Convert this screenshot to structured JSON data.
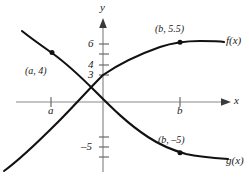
{
  "figure": {
    "background_color": "#ffffff",
    "axis_color": "#808080",
    "curve_color": "#111111",
    "label_color": "#1a1a1a"
  },
  "axes": {
    "x_axis_label": "x",
    "y_axis_label": "y",
    "x_ticks": [
      {
        "label": "a",
        "value": "a",
        "px": 51
      },
      {
        "label": "b",
        "value": "b",
        "px": 180
      }
    ],
    "y_ticks": [
      {
        "label": "6",
        "value": 6,
        "px": 44
      },
      {
        "label": "",
        "value": 5,
        "px": 54
      },
      {
        "label": "4",
        "value": 4,
        "px": 65
      },
      {
        "label": "3",
        "value": 3,
        "px": 75
      },
      {
        "label": "",
        "value": 2,
        "px": 85
      },
      {
        "label": "-5",
        "value": -5,
        "px": 147
      },
      {
        "label": "",
        "value": -4,
        "px": 137
      },
      {
        "label": "",
        "value": -6,
        "px": 157
      }
    ]
  },
  "chart_data": {
    "type": "line",
    "title": "",
    "subtitle": "",
    "xlabel": "x",
    "ylabel": "y",
    "grid": false,
    "legend_position": "inline-curve-end",
    "xlim": [
      -1.45,
      2.2
    ],
    "ylim": [
      -7.0,
      7.6
    ],
    "annotations": [
      {
        "text": "(a, 4)",
        "x": "a",
        "y": 4,
        "series": "g(x)"
      },
      {
        "text": "(b, 5.5)",
        "x": "b",
        "y": 5.5,
        "series": "f(x)"
      },
      {
        "text": "(b, -5)",
        "x": "b",
        "y": -5,
        "series": "g(x)"
      }
    ],
    "marked_points": [
      {
        "label": "(a, 4)",
        "series": "g(x)",
        "x_value": "a",
        "y_value": 4
      },
      {
        "label": "(b, 5.5)",
        "series": "f(x)",
        "x_value": "b",
        "y_value": 5.5
      },
      {
        "label": "(b, -5)",
        "series": "g(x)",
        "x_value": "b",
        "y_value": -5
      }
    ],
    "series": [
      {
        "name": "f(x)",
        "description": "increasing S-shaped curve passing through (0, 3) and (b, 5.5)",
        "path": "M 4 171 C 22 158, 40 140, 58 122 C 74 106, 88 90, 103 75 C 122 62, 140 54, 160 47 C 172 43, 186 41, 200 41 C 212 41, 219 41, 224 42",
        "values": [
          {
            "x": -1.42,
            "y": -6.8
          },
          {
            "x": -1.0,
            "y": -4.6
          },
          {
            "x": -0.6,
            "y": -1.9
          },
          {
            "x": -0.3,
            "y": 0.7
          },
          {
            "x": 0.0,
            "y": 3.0
          },
          {
            "x": 0.4,
            "y": 4.1
          },
          {
            "x": 0.8,
            "y": 4.8
          },
          {
            "x": 1.2,
            "y": 5.3
          },
          {
            "x": 1.6,
            "y": 5.5
          },
          {
            "x": 2.0,
            "y": 5.5
          }
        ]
      },
      {
        "name": "g(x)",
        "description": "decreasing curve passing through (a, 4) and (b, -5)",
        "path": "M 22 31 C 32 39, 42 46, 52 53 C 66 63, 80 76, 96 92 C 112 108, 128 124, 148 137 C 160 145, 172 150, 186 154 C 200 157, 214 158, 228 159",
        "values": [
          {
            "x": -1.28,
            "y": 6.6
          },
          {
            "x": -1.05,
            "y": 5.5
          },
          {
            "x": -0.78,
            "y": 4.0
          },
          {
            "x": -0.5,
            "y": 2.2
          },
          {
            "x": -0.16,
            "y": 0.0
          },
          {
            "x": 0.2,
            "y": -2.0
          },
          {
            "x": 0.7,
            "y": -3.7
          },
          {
            "x": 1.25,
            "y": -4.7
          },
          {
            "x": 1.6,
            "y": -5.0
          },
          {
            "x": 2.05,
            "y": -5.5
          }
        ]
      }
    ]
  },
  "labels": {
    "f_label": "f(x)",
    "g_label": "g(x)",
    "point_a4": "(a, 4)",
    "point_b55": "(b, 5.5)",
    "point_bneg5": "(b, –5)",
    "tick_a": "a",
    "tick_b": "b",
    "tick_6": "6",
    "tick_4": "4",
    "tick_3": "3",
    "tick_neg5": "–5",
    "axis_x": "x",
    "axis_y": "y"
  }
}
